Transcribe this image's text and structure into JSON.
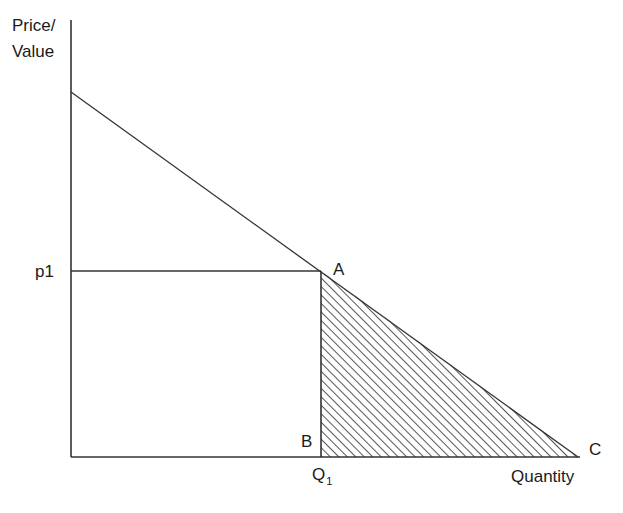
{
  "diagram": {
    "type": "consumer-surplus / deadweight-loss demand diagram",
    "y_axis_label_line1": "Price/",
    "y_axis_label_line2": "Value",
    "x_axis_label": "Quantity",
    "price_label": "p1",
    "quantity_label_main": "Q",
    "quantity_label_sub": "1",
    "point_a": "A",
    "point_b": "B",
    "point_c": "C",
    "colors": {
      "line": "#333333",
      "hatch": "#444444",
      "background": "#ffffff"
    },
    "geometry": {
      "origin": [
        71,
        457
      ],
      "y_axis_top": [
        71,
        20
      ],
      "x_axis_end": [
        580,
        457
      ],
      "demand_start": [
        71,
        92
      ],
      "point_A": [
        321,
        271
      ],
      "point_B": [
        321,
        457
      ],
      "point_C": [
        578,
        457
      ],
      "p1_level_y": 271,
      "shaded_region": "triangle A-B-C (hatched)"
    }
  }
}
